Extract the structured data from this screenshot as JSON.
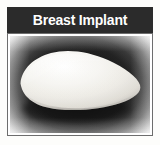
{
  "figure": {
    "title": "Breast Implant",
    "title_bar_color": "#2b2b2b",
    "title_text_color": "#ffffff",
    "frame_border_color": "#6d6d6d",
    "page_background": "#fdfdfb"
  },
  "photo": {
    "subject": "breast-implant",
    "description": "Teardrop-shaped silicone breast implant photographed on a dark vignetted background",
    "backdrop_dark_color": "#0d0d0d",
    "backdrop_edge_color": "#f7f7f5",
    "implant_highlight_color": "#ffffff",
    "implant_midtone_color": "#e9e8e3",
    "implant_shadow_color": "#b9b7b1"
  }
}
